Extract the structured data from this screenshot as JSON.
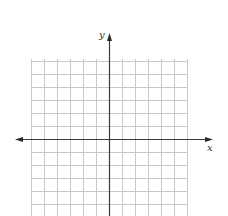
{
  "chart_data": {
    "type": "coordinate-grid",
    "title": "",
    "xlabel": "x",
    "ylabel": "y",
    "grid": true,
    "x_range_cells": [
      -6,
      6
    ],
    "y_range_cells": [
      -6,
      6
    ],
    "grid_visible_rows_above_axis": 6,
    "grid_visible_rows_below_axis": 6,
    "tick_labels": [],
    "data_points": []
  },
  "labels": {
    "x_axis": "x",
    "y_axis": "y"
  },
  "colors": {
    "grid": "#c8c8c8",
    "axis": "#3a3a3a",
    "label": "#333333",
    "background": "#ffffff"
  },
  "geometry": {
    "grid_left": 31,
    "grid_right": 187,
    "grid_top": 59,
    "grid_bottom": 216,
    "cell": 13,
    "origin_x": 109,
    "origin_y": 139,
    "x_axis_left": 15,
    "x_axis_right": 213,
    "y_axis_top": 33
  }
}
